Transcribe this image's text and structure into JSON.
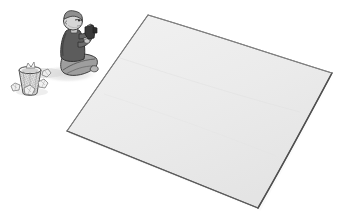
{
  "illustration": {
    "title": "Person sitting cross-legged with a camera beside a large blank sheet",
    "style": "hand-drawn pencil sketch, grayscale",
    "background_color": "#ffffff",
    "canvas": {
      "width": 343,
      "height": 224
    }
  },
  "objects": {
    "sheet": {
      "name": "large blank sheet",
      "description": "Large light-gray quadrilateral lying flat in perspective, like a blank canvas, tarp or paper on the ground",
      "fill_color": "#ececec",
      "edge_color": "#6e6e6e",
      "shadow_color": "#c9c9c9",
      "corners": {
        "top": [
          148,
          15
        ],
        "right": [
          332,
          73
        ],
        "bottom": [
          258,
          208
        ],
        "left": [
          67,
          131
        ]
      }
    },
    "person": {
      "name": "seated person",
      "description": "Person seated cross-legged on the ground, facing right, holding a small camera up with both hands",
      "pose": "cross-legged",
      "skin_color": "#d6d6d6",
      "hair_color": "#8f8f8f",
      "shirt_color": "#5c5c5c",
      "pants_color": "#9e9e9e",
      "outline_color": "#3d3d3d",
      "position": [
        62,
        12
      ]
    },
    "camera": {
      "name": "camera held in hands",
      "description": "Small dark handheld camera or phone raised to eye level",
      "color": "#3a3a3a",
      "position": [
        84,
        26
      ]
    },
    "wastebasket": {
      "name": "mesh wastebasket",
      "description": "Tapered wire-mesh wastebasket with cross-hatched weave texture",
      "fill_color": "#e2e2e2",
      "mesh_color": "#8c8c8c",
      "outline_color": "#4a4a4a",
      "position": [
        16,
        63
      ]
    },
    "paper_balls": {
      "name": "crumpled paper balls",
      "description": "Several crumpled sheets of paper scattered on the ground around the wastebasket",
      "count": 4,
      "fill_color": "#eeeeee",
      "outline_color": "#6a6a6a"
    },
    "ground_shadow": {
      "name": "ground shadow",
      "description": "Soft gray shadow cast on the ground beneath and to the left of the seated person",
      "color": "#d8d8d8"
    }
  },
  "labels": {
    "alt_text": "A grayscale sketch of a person sitting cross-legged holding a camera, with a mesh wastebasket and crumpled papers to their left, and a large empty sheet spread out on the ground to their right."
  }
}
